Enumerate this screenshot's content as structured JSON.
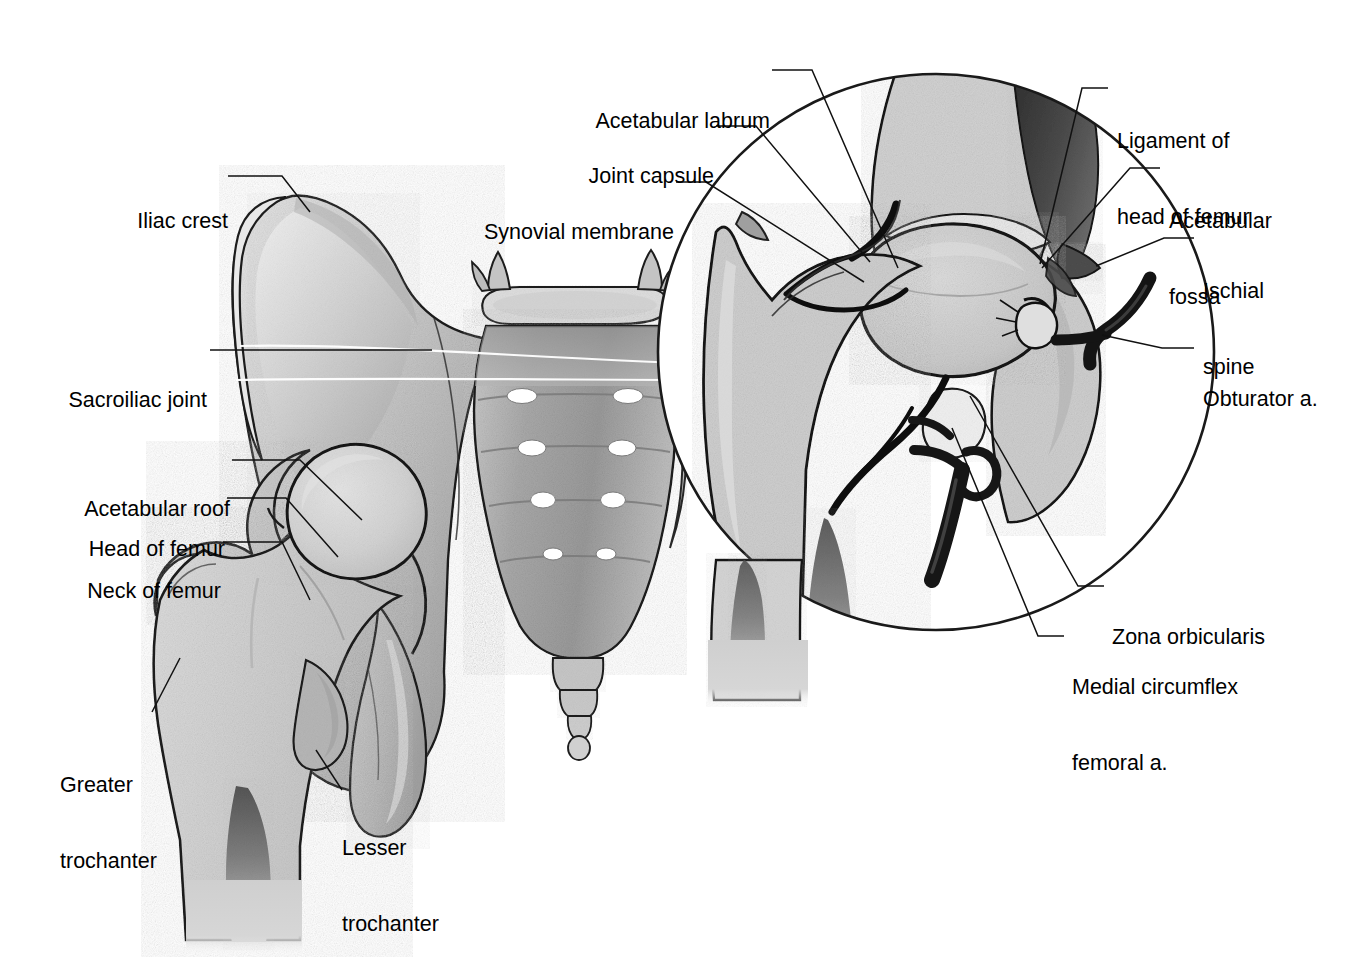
{
  "figure": {
    "style": "grayscale medical line drawing",
    "colors": {
      "background": "#ffffff",
      "outline": "#1a1a1a",
      "bone_light": "#d8d8d8",
      "bone_mid": "#bfbfbf",
      "bone_dark": "#9a9a9a",
      "cartilage": "#efefef",
      "soft_tissue_dark": "#3a3a3a",
      "vessel": "#141414",
      "marrow": "#8a8a8a",
      "leader_line": "#111111",
      "section_line": "#ffffff"
    }
  },
  "labels": {
    "left_figure": [
      {
        "id": "iliac-crest",
        "text": "Iliac crest",
        "align": "right",
        "x": 131,
        "y": 158,
        "lines": [
          "Iliac crest"
        ]
      },
      {
        "id": "sacroiliac-joint",
        "text": "Sacroiliac joint",
        "align": "right",
        "x": 72,
        "y": 337,
        "lines": [
          "Sacroiliac joint"
        ]
      },
      {
        "id": "acetabular-roof",
        "text": "Acetabular roof",
        "align": "right",
        "x": 79,
        "y": 446,
        "lines": [
          "Acetabular roof"
        ]
      },
      {
        "id": "head-of-femur",
        "text": "Head of femur",
        "align": "right",
        "x": 79,
        "y": 486,
        "lines": [
          "Head of femur"
        ]
      },
      {
        "id": "neck-of-femur",
        "text": "Neck of femur",
        "align": "right",
        "x": 83,
        "y": 528,
        "lines": [
          "Neck of femur"
        ]
      },
      {
        "id": "greater-trochanter",
        "text": "Greater trochanter",
        "align": "left",
        "x": 60,
        "y": 722,
        "lines": [
          "Greater",
          "trochanter"
        ]
      },
      {
        "id": "lesser-trochanter",
        "text": "Lesser trochanter",
        "align": "left",
        "x": 342,
        "y": 785,
        "lines": [
          "Lesser",
          "trochanter"
        ]
      }
    ],
    "inset_left": [
      {
        "id": "acetabular-labrum",
        "text": "Acetabular labrum",
        "align": "right",
        "x": 598,
        "y": 58,
        "lines": [
          "Acetabular labrum"
        ]
      },
      {
        "id": "joint-capsule",
        "text": "Joint capsule",
        "align": "right",
        "x": 586,
        "y": 112,
        "lines": [
          "Joint capsule"
        ]
      },
      {
        "id": "synovial-membrane",
        "text": "Synovial membrane",
        "align": "right",
        "x": 482,
        "y": 168,
        "lines": [
          "Synovial membrane"
        ]
      }
    ],
    "inset_right": [
      {
        "id": "ligament-of-head-of-femur",
        "text": "Ligament of head of femur",
        "align": "left",
        "x": 1117,
        "y": 78,
        "lines": [
          "Ligament of",
          "head of femur"
        ]
      },
      {
        "id": "acetabular-fossa",
        "text": "Acetabular fossa",
        "align": "left",
        "x": 1169,
        "y": 158,
        "lines": [
          "Acetabular",
          "fossa"
        ]
      },
      {
        "id": "ischial-spine",
        "text": "Ischial spine",
        "align": "left",
        "x": 1203,
        "y": 228,
        "lines": [
          "Ischial",
          "spine"
        ]
      },
      {
        "id": "obturator-a",
        "text": "Obturator a.",
        "align": "left",
        "x": 1203,
        "y": 336,
        "lines": [
          "Obturator a."
        ]
      },
      {
        "id": "zona-orbicularis",
        "text": "Zona orbicularis",
        "align": "left",
        "x": 1112,
        "y": 574,
        "lines": [
          "Zona orbicularis"
        ]
      },
      {
        "id": "medial-circumflex-femoral-a",
        "text": "Medial circumflex femoral a.",
        "align": "left",
        "x": 1072,
        "y": 624,
        "lines": [
          "Medial circumflex",
          "femoral a."
        ]
      }
    ]
  },
  "structures": {
    "left_figure": [
      "ilium",
      "iliac-crest",
      "anterior-superior-iliac-spine",
      "sacroiliac-joint",
      "sacrum",
      "coccyx",
      "lumbar-vertebra-L5",
      "sacral-foramina",
      "acetabulum",
      "acetabular-roof",
      "femoral-head",
      "femoral-neck",
      "greater-trochanter",
      "lesser-trochanter",
      "femoral-shaft",
      "medullary-cavity",
      "pubis",
      "ischium",
      "ischial-tuberosity"
    ],
    "inset": [
      "magnifier-circle",
      "femoral-head-section",
      "femoral-neck-section",
      "greater-trochanter-section",
      "femoral-shaft-section",
      "medullary-cavity-section",
      "acetabular-labrum",
      "joint-capsule",
      "synovial-membrane",
      "ligament-of-head-of-femur",
      "acetabular-fossa",
      "ischial-spine",
      "obturator-artery",
      "medial-circumflex-femoral-artery",
      "zona-orbicularis",
      "articular-cartilage",
      "trabecular-bone"
    ]
  },
  "counts": {
    "sacral_foramina_pairs": 4,
    "total_labels": 16
  }
}
